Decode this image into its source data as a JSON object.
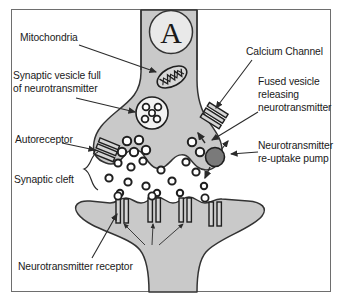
{
  "figure": {
    "axon_marker": "A",
    "background_color": "#ffffff",
    "border_color": "#6e6e6e",
    "cell_fill_color": "#c9c9c9",
    "outline_color": "#333333",
    "pump_color": "#7a7a7a",
    "text_color": "#1a1a1a"
  },
  "labels": {
    "mitochondria": "Mitochondria",
    "synaptic_vesicle_line1": "Synaptic vesicle full",
    "synaptic_vesicle_line2": "of neurotransmitter",
    "autoreceptor": "Autoreceptor",
    "synaptic_cleft": "Synaptic cleft",
    "neurotransmitter_receptor": "Neurotransmitter receptor",
    "calcium_channel": "Calcium Channel",
    "fused_vesicle_line1": "Fused vesicle",
    "fused_vesicle_line2": "releasing",
    "fused_vesicle_line3": "neurotransmitter",
    "reuptake_line1": "Neurotransmitter",
    "reuptake_line2": "re-uptake pump"
  },
  "structures": {
    "axon": "presynaptic-axon",
    "terminal": "presynaptic-terminal",
    "dendrite": "postsynaptic-dendrite",
    "cleft": "synaptic-cleft",
    "receptor_count": 4,
    "vesicle_molecule_count": 5,
    "free_molecule_count": 14
  }
}
